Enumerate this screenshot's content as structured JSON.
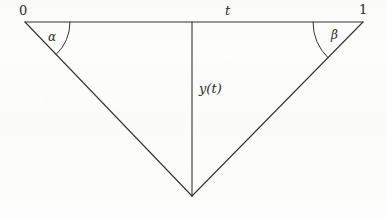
{
  "figure": {
    "kind": "geometry-diagram",
    "stroke_color": "#333333",
    "background_color": "#fdfdfc",
    "stroke_width": 1,
    "labels": {
      "left_endpoint": "0",
      "right_endpoint": "1",
      "base_point": "t",
      "vertical_segment": "y(t)",
      "left_angle": "α",
      "right_angle": "β"
    },
    "geometry": {
      "left_vertex": {
        "x": 25,
        "y": 22
      },
      "right_vertex": {
        "x": 363,
        "y": 22
      },
      "apex_vertex": {
        "x": 192,
        "y": 196
      },
      "base_point_on_axis": {
        "x": 192,
        "y": 22
      },
      "left_arc_radius": 45,
      "right_arc_radius": 50
    },
    "label_positions": {
      "left_endpoint": {
        "x": 19,
        "y": 4
      },
      "right_endpoint": {
        "x": 359,
        "y": 3
      },
      "base_point": {
        "x": 225,
        "y": 4
      },
      "vertical_segment": {
        "x": 199,
        "y": 82
      },
      "left_angle": {
        "x": 48,
        "y": 31
      },
      "right_angle": {
        "x": 331,
        "y": 29
      }
    }
  }
}
